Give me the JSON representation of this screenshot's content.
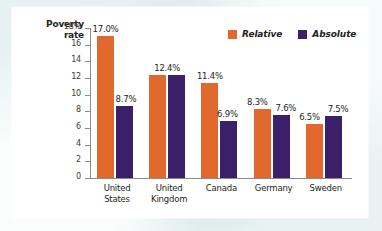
{
  "chart_data": {
    "type": "bar",
    "title": "",
    "xlabel": "",
    "ylabel_lines": [
      "Poverty",
      "rate"
    ],
    "ylabel": "Poverty rate",
    "categories": [
      "United States",
      "United Kingdom",
      "Canada",
      "Germany",
      "Sweden"
    ],
    "category_lines": [
      [
        "United",
        "States"
      ],
      [
        "United",
        "Kingdom"
      ],
      [
        "Canada"
      ],
      [
        "Germany"
      ],
      [
        "Sweden"
      ]
    ],
    "series": [
      {
        "name": "Relative",
        "color": "#e1692e",
        "values": [
          17.0,
          12.4,
          11.4,
          8.3,
          6.5
        ],
        "labels": [
          "17.0%",
          "12.4%",
          "11.4%",
          "8.3%",
          "6.5%"
        ]
      },
      {
        "name": "Absolute",
        "color": "#3b2069",
        "values": [
          8.7,
          12.4,
          6.9,
          7.6,
          7.5
        ],
        "labels": [
          "8.7%",
          "12.4%",
          "6.9%",
          "7.6%",
          "7.5%"
        ]
      }
    ],
    "ylim": [
      0,
      18
    ],
    "y_ticks": [
      18,
      16,
      14,
      12,
      10,
      8,
      6,
      4,
      2,
      0
    ],
    "y_tick_labels": [
      "18%",
      "16",
      "14",
      "12",
      "10",
      "8",
      "6",
      "4",
      "2",
      "0"
    ],
    "grid": false,
    "legend_position": "top-right",
    "legend": [
      "Relative",
      "Absolute"
    ]
  },
  "colors": {
    "relative": "#e1692e",
    "absolute": "#3b2069",
    "axis": "#8a8a8a",
    "text": "#231f20",
    "panel": "#ffffff",
    "background": "#dfe9e9"
  }
}
